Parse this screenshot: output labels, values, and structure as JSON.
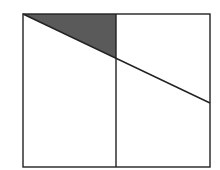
{
  "diagram": {
    "outer_rect": {
      "x1": 23,
      "y1": 14,
      "x2": 210,
      "y2": 167
    },
    "divider_x": 116,
    "diagonal": {
      "x1": 23,
      "y1": 14,
      "x2": 210,
      "y2": 103
    },
    "shaded_triangle": [
      [
        23,
        14
      ],
      [
        116,
        14
      ],
      [
        116,
        58
      ]
    ],
    "colors": {
      "stroke": "#222222",
      "shade": "#5a5a5a",
      "background": "#ffffff"
    }
  }
}
